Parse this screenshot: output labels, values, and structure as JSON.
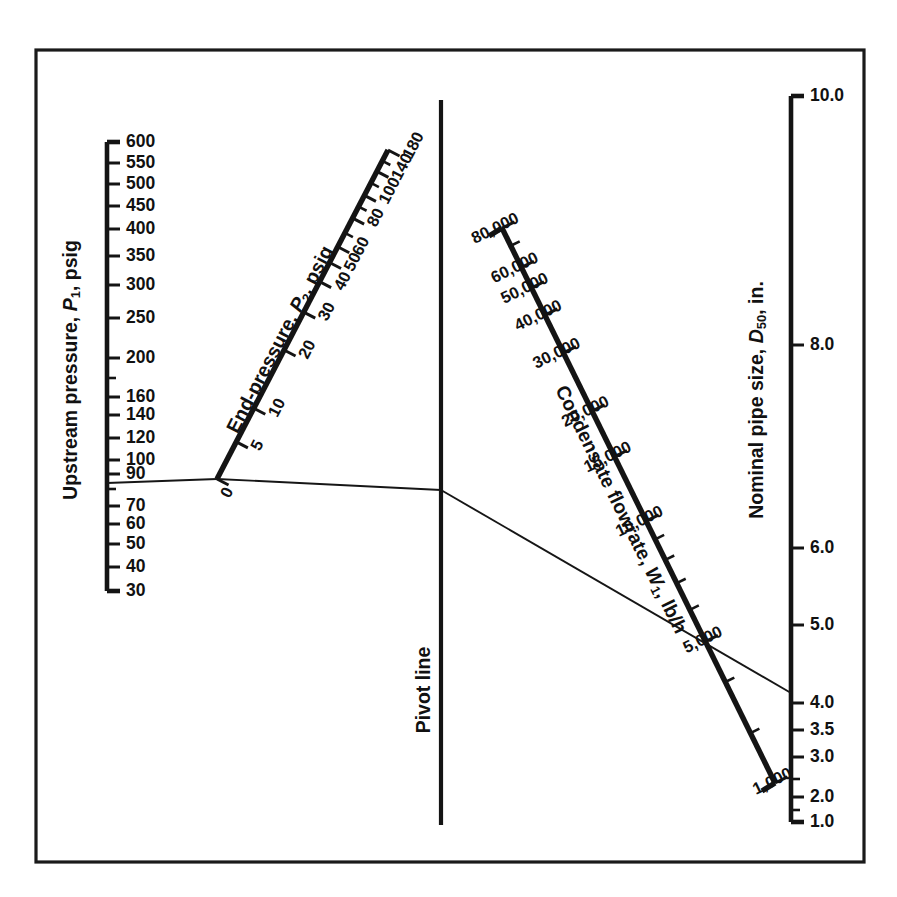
{
  "figure": {
    "kind": "nomograph",
    "background_color": "#ffffff",
    "ink_color": "#141414",
    "frame": {
      "x": 36,
      "y": 50,
      "width": 828,
      "height": 812
    }
  },
  "chart_data": {
    "type": "line",
    "title": "",
    "subtitle": "",
    "xlabel": "",
    "ylabel": "",
    "grid": false,
    "legend_position": "none",
    "axes": [
      {
        "name": "upstream-pressure",
        "label": "Upstream pressure, P",
        "label_sub": "1",
        "label_units": ", psig",
        "units": "psig",
        "orientation": "vertical",
        "scale": "log",
        "range": [
          30,
          600
        ],
        "tick_labels": [
          "600",
          "550",
          "500",
          "450",
          "400",
          "350",
          "300",
          "250",
          "200",
          "160",
          "140",
          "120",
          "100",
          "90",
          "70",
          "60",
          "50",
          "40",
          "30"
        ],
        "tick_values": [
          600,
          550,
          500,
          450,
          400,
          350,
          300,
          250,
          200,
          160,
          140,
          120,
          100,
          90,
          70,
          60,
          50,
          40,
          30
        ],
        "unlabeled_ticks": [
          180,
          80
        ]
      },
      {
        "name": "end-pressure",
        "label": "End-pressure, P",
        "label_sub": "2",
        "label_units": ", psig",
        "units": "psig",
        "orientation": "diagonal",
        "scale": "nonlinear",
        "range": [
          0,
          180
        ],
        "tick_labels": [
          "180",
          "140",
          "100",
          "80",
          "60",
          "50",
          "40",
          "30",
          "20",
          "10",
          "5",
          "0"
        ],
        "tick_values": [
          180,
          140,
          100,
          80,
          60,
          50,
          40,
          30,
          20,
          10,
          5,
          0
        ],
        "unlabeled_ticks": [
          160,
          120,
          90,
          70
        ]
      },
      {
        "name": "condensate-flowrate",
        "label": "Condensate flowrate, W",
        "label_sub": "1",
        "label_units": ", lb/h",
        "units": "lb/h",
        "orientation": "diagonal",
        "scale": "log",
        "range": [
          1000,
          80000
        ],
        "tick_labels": [
          "80,000",
          "60,000",
          "50,000",
          "40,000",
          "30,000",
          "20,000",
          "15,000",
          "10,000",
          "5,000",
          "1,000"
        ],
        "tick_values": [
          80000,
          60000,
          50000,
          40000,
          30000,
          20000,
          15000,
          10000,
          5000,
          1000
        ],
        "unlabeled_ticks": [
          70000,
          9000,
          8000,
          7000,
          6000,
          4000,
          3000,
          2000
        ]
      },
      {
        "name": "nominal-pipe-size",
        "label": "Nominal pipe size, D",
        "label_sub": "50",
        "label_units": ", in.",
        "units": "in.",
        "orientation": "vertical",
        "scale": "nonlinear",
        "range": [
          1.0,
          10.0
        ],
        "tick_labels": [
          "10.0",
          "8.0",
          "6.0",
          "5.0",
          "4.0",
          "3.5",
          "3.0",
          "2.0",
          "1.0"
        ],
        "tick_values": [
          10.0,
          8.0,
          6.0,
          5.0,
          4.0,
          3.5,
          3.0,
          2.0,
          1.0
        ],
        "unlabeled_ticks": [
          2.5,
          1.5
        ]
      }
    ],
    "pivot": {
      "label": "Pivot line",
      "orientation": "vertical"
    },
    "isopleth": {
      "label": "",
      "segments": [
        {
          "from_axis": "upstream-pressure",
          "from_value": 80,
          "to_axis": "end-pressure",
          "to_value": 0,
          "via": "pivot"
        },
        {
          "from_axis": "end-pressure",
          "from_value": 0,
          "to_axis": "pivot",
          "to_value": null
        },
        {
          "from_axis": "pivot",
          "to_axis": "condensate-flowrate",
          "to_value": 5500
        },
        {
          "from_axis": "condensate-flowrate",
          "from_value": 5500,
          "to_axis": "nominal-pipe-size",
          "to_value": 4.1
        }
      ]
    }
  },
  "labels": {
    "p1_title_main": "Upstream pressure, ",
    "p1_title_var": "P",
    "p1_title_sub": "1",
    "p1_title_tail": ", psig",
    "p2_title_main": "End-pressure, ",
    "p2_title_var": "P",
    "p2_title_sub": "2",
    "p2_title_tail": ", psig",
    "w_title_main": "Condensate flowrate, ",
    "w_title_var": "W",
    "w_title_sub": "1",
    "w_title_tail": ", lb/h",
    "d_title_main": "Nominal pipe size, ",
    "d_title_var": "D",
    "d_title_sub": "50",
    "d_title_tail": ", in.",
    "pivot_label": "Pivot line"
  },
  "p1_ticks": [
    {
      "label": "600",
      "y": 142,
      "major": true
    },
    {
      "label": "550",
      "y": 163,
      "major": true
    },
    {
      "label": "500",
      "y": 184,
      "major": true
    },
    {
      "label": "450",
      "y": 206,
      "major": true
    },
    {
      "label": "400",
      "y": 229,
      "major": true
    },
    {
      "label": "350",
      "y": 256,
      "major": true
    },
    {
      "label": "300",
      "y": 285,
      "major": true
    },
    {
      "label": "250",
      "y": 318,
      "major": true
    },
    {
      "label": "200",
      "y": 358,
      "major": true
    },
    {
      "label": "",
      "y": 378,
      "major": false
    },
    {
      "label": "160",
      "y": 397,
      "major": true
    },
    {
      "label": "140",
      "y": 415,
      "major": true
    },
    {
      "label": "120",
      "y": 438,
      "major": true
    },
    {
      "label": "100",
      "y": 460,
      "major": true
    },
    {
      "label": "90",
      "y": 474,
      "major": true
    },
    {
      "label": "",
      "y": 489,
      "major": false
    },
    {
      "label": "70",
      "y": 506,
      "major": true
    },
    {
      "label": "60",
      "y": 524,
      "major": true
    },
    {
      "label": "50",
      "y": 544,
      "major": true
    },
    {
      "label": "40",
      "y": 567,
      "major": true
    },
    {
      "label": "30",
      "y": 591,
      "major": true
    }
  ],
  "p2_ticks": [
    {
      "label": "180",
      "t": 1.0,
      "major": true
    },
    {
      "label": "",
      "t": 0.967,
      "major": false
    },
    {
      "label": "140",
      "t": 0.935,
      "major": true
    },
    {
      "label": "",
      "t": 0.9,
      "major": false
    },
    {
      "label": "100",
      "t": 0.862,
      "major": true
    },
    {
      "label": "",
      "t": 0.828,
      "major": false
    },
    {
      "label": "80",
      "t": 0.793,
      "major": true
    },
    {
      "label": "",
      "t": 0.748,
      "major": false
    },
    {
      "label": "60",
      "t": 0.706,
      "major": true
    },
    {
      "label": "50",
      "t": 0.658,
      "major": true
    },
    {
      "label": "40",
      "t": 0.6,
      "major": true
    },
    {
      "label": "30",
      "t": 0.507,
      "major": true
    },
    {
      "label": "20",
      "t": 0.392,
      "major": true
    },
    {
      "label": "10",
      "t": 0.215,
      "major": true
    },
    {
      "label": "5",
      "t": 0.113,
      "major": true
    },
    {
      "label": "0",
      "t": 0.0,
      "major": true
    }
  ],
  "w_ticks": [
    {
      "label": "80,000",
      "t": 0.0,
      "major": true
    },
    {
      "label": "",
      "t": 0.032,
      "major": false
    },
    {
      "label": "60,000",
      "t": 0.071,
      "major": true
    },
    {
      "label": "50,000",
      "t": 0.108,
      "major": true
    },
    {
      "label": "40,000",
      "t": 0.157,
      "major": true
    },
    {
      "label": "30,000",
      "t": 0.225,
      "major": true
    },
    {
      "label": "20,000",
      "t": 0.33,
      "major": true
    },
    {
      "label": "15,000",
      "t": 0.412,
      "major": true
    },
    {
      "label": "10,000",
      "t": 0.528,
      "major": true
    },
    {
      "label": "",
      "t": 0.561,
      "major": false
    },
    {
      "label": "",
      "t": 0.598,
      "major": false
    },
    {
      "label": "",
      "t": 0.64,
      "major": false
    },
    {
      "label": "",
      "t": 0.688,
      "major": false
    },
    {
      "label": "5,000",
      "t": 0.745,
      "major": true
    },
    {
      "label": "",
      "t": 0.818,
      "major": false
    },
    {
      "label": "",
      "t": 0.91,
      "major": false
    },
    {
      "label": "1,000",
      "t": 1.0,
      "major": true
    }
  ],
  "d_ticks": [
    {
      "label": "10.0",
      "y": 96,
      "major": true
    },
    {
      "label": "8.0",
      "y": 345,
      "major": true
    },
    {
      "label": "6.0",
      "y": 548,
      "major": true
    },
    {
      "label": "5.0",
      "y": 625,
      "major": true
    },
    {
      "label": "4.0",
      "y": 703,
      "major": true
    },
    {
      "label": "3.5",
      "y": 730,
      "major": true
    },
    {
      "label": "3.0",
      "y": 757,
      "major": true
    },
    {
      "label": "",
      "y": 779,
      "major": false
    },
    {
      "label": "2.0",
      "y": 797,
      "major": true
    },
    {
      "label": "",
      "y": 810,
      "major": false
    },
    {
      "label": "1.0",
      "y": 822,
      "major": true
    }
  ]
}
